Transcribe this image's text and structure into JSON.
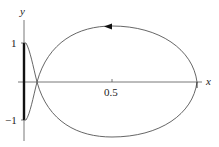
{
  "figure": {
    "axes": {
      "x_label": "x",
      "y_label": "y",
      "x_ticks": [
        "0.5"
      ],
      "y_ticks": [
        "1",
        "−1"
      ]
    },
    "curve": {
      "description": "closed trajectory loop with arrow indicating counter-clockwise direction on top arc",
      "direction_arrow": "left-pointing arrowhead on upper arc"
    },
    "colors": {
      "axis": "#444444",
      "curve": "#555555",
      "thick_segment": "#111111"
    }
  }
}
